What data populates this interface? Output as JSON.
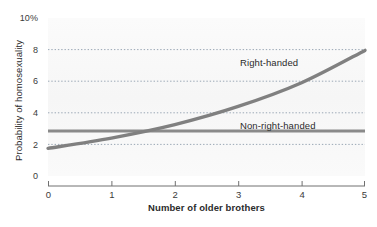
{
  "chart_data": {
    "type": "line",
    "title": "",
    "xlabel": "Number of older brothers",
    "ylabel": "Probability of homosexuality",
    "xlim": [
      0,
      5
    ],
    "ylim": [
      0,
      10
    ],
    "xticks": [
      "0",
      "1",
      "2",
      "3",
      "4",
      "5"
    ],
    "yticks": [
      "0",
      "2",
      "4",
      "6",
      "8",
      "10%"
    ],
    "ytick_values": [
      0,
      2,
      4,
      6,
      8,
      10
    ],
    "grid": "horizontal-dotted",
    "gridlines_at": [
      2,
      4,
      6,
      8
    ],
    "legend": "inline-annotations",
    "x": [
      0,
      1,
      2,
      3,
      4,
      5
    ],
    "series": [
      {
        "name": "Right-handed",
        "values": [
          1.75,
          2.4,
          3.25,
          4.4,
          5.9,
          7.95
        ],
        "color": "#808080",
        "shape": "exponential-increasing"
      },
      {
        "name": "Non-right-handed",
        "values": [
          2.85,
          2.85,
          2.85,
          2.85,
          2.85,
          2.85
        ],
        "color": "#8a8a8a",
        "shape": "flat"
      }
    ],
    "annotations": [
      {
        "text": "Right-handed",
        "x": 3.0,
        "y": 6.6
      },
      {
        "text": "Non-right-handed",
        "x": 3.0,
        "y": 2.4
      }
    ]
  },
  "axes": {
    "y_title": "Probability of homosexuality",
    "x_title": "Number of older brothers",
    "y_tick_labels": [
      "10%",
      "8",
      "6",
      "4",
      "2",
      "0"
    ],
    "x_tick_labels": [
      "0",
      "1",
      "2",
      "3",
      "4",
      "5"
    ]
  },
  "labels": {
    "right_handed": "Right-handed",
    "non_right_handed": "Non-right-handed"
  },
  "colors": {
    "line": "#808080",
    "gridline": "#9aa7b5",
    "axis": "#6b6b6b",
    "text": "#2b2b2b",
    "plot_background": "#f8f8f8"
  }
}
